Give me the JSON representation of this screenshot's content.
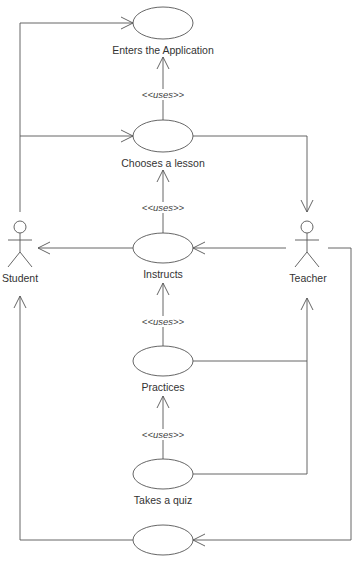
{
  "diagram": {
    "type": "uml-use-case",
    "line_color": "#555555",
    "actors": [
      {
        "id": "student",
        "label": "Student"
      },
      {
        "id": "teacher",
        "label": "Teacher"
      }
    ],
    "use_cases": [
      {
        "id": "enters",
        "label": "Enters the Application"
      },
      {
        "id": "chooses",
        "label": "Chooses a lesson"
      },
      {
        "id": "instructs",
        "label": "Instructs"
      },
      {
        "id": "practices",
        "label": "Practices"
      },
      {
        "id": "quiz",
        "label": "Takes a quiz"
      },
      {
        "id": "unlabeled",
        "label": ""
      }
    ],
    "stereotypes": [
      {
        "from": "chooses",
        "to": "enters",
        "label": "<<uses>>"
      },
      {
        "from": "instructs",
        "to": "chooses",
        "label": "<<uses>>"
      },
      {
        "from": "practices",
        "to": "instructs",
        "label": "<<uses>>"
      },
      {
        "from": "quiz",
        "to": "practices",
        "label": "<<uses>>"
      }
    ],
    "associations": [
      {
        "from": "student",
        "to": "enters"
      },
      {
        "from": "student",
        "to": "chooses"
      },
      {
        "from": "chooses",
        "to": "teacher"
      },
      {
        "from": "instructs",
        "to": "student"
      },
      {
        "from": "teacher",
        "to": "instructs"
      },
      {
        "from": "practices",
        "to": "teacher"
      },
      {
        "from": "quiz",
        "to": "teacher"
      },
      {
        "from": "teacher",
        "to": "unlabeled"
      },
      {
        "from": "unlabeled",
        "to": "student"
      }
    ]
  }
}
